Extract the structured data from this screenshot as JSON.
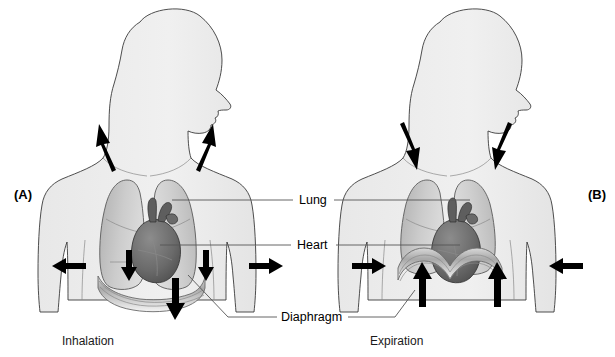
{
  "figure": {
    "background_color": "#ffffff"
  },
  "panels": [
    {
      "id": "A",
      "letter": "(A)",
      "caption": "Inhalation",
      "letter_x": 14,
      "letter_y": 199,
      "caption_x": 62,
      "caption_y": 345,
      "arrow_direction_summary": "outward-and-up at shoulders, outward at sides, downward at diaphragm"
    },
    {
      "id": "B",
      "letter": "(B)",
      "caption": "Expiration",
      "letter_x": 588,
      "letter_y": 199,
      "caption_x": 370,
      "caption_y": 345,
      "arrow_direction_summary": "inward-and-down at shoulders, inward at sides, upward at diaphragm"
    }
  ],
  "part_labels": [
    {
      "name": "Lung",
      "text": "Lung",
      "x": 299,
      "y": 204
    },
    {
      "name": "Heart",
      "text": "Heart",
      "x": 297,
      "y": 248
    },
    {
      "name": "Diaphragm",
      "text": "Diaphragm",
      "x": 281,
      "y": 321
    }
  ],
  "colors": {
    "body_fill": "#eeeeee",
    "body_outline": "#3a3a3a",
    "lung_fill": "#c9c9c9",
    "lung_outline": "#5a5a5a",
    "heart_fill": "#6e6e6e",
    "heart_outline": "#2e2e2e",
    "diaphragm_fill": "#b5b5b5",
    "arrow_color": "#000000",
    "leader_color": "#555555",
    "text_color": "#000000"
  },
  "anatomy": {
    "organs": [
      {
        "name": "lung-left",
        "label": "Lung"
      },
      {
        "name": "lung-right",
        "label": "Lung"
      },
      {
        "name": "heart",
        "label": "Heart"
      },
      {
        "name": "diaphragm",
        "label": "Diaphragm"
      }
    ]
  }
}
